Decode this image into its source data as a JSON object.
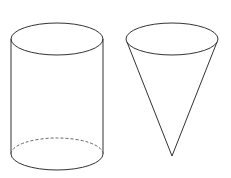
{
  "diagram": {
    "background": "#ffffff",
    "line_color": "#333333",
    "shapes": [
      {
        "name": "cylinder",
        "top_ellipse": {
          "cx": 57,
          "cy": 39,
          "rx": 46,
          "ry": 16
        },
        "bottom_ellipse": {
          "cx": 57,
          "cy": 154,
          "rx": 46,
          "ry": 16,
          "back_half": "dashed"
        },
        "sides": [
          {
            "x": 11,
            "y1": 39,
            "y2": 154
          },
          {
            "x": 103,
            "y1": 39,
            "y2": 154
          }
        ]
      },
      {
        "name": "cone",
        "top_ellipse": {
          "cx": 172,
          "cy": 39,
          "rx": 46,
          "ry": 16
        },
        "apex": {
          "x": 172,
          "y": 156
        },
        "sides": [
          {
            "x1": 127,
            "y1": 42,
            "x2": 172,
            "y2": 156
          },
          {
            "x1": 217,
            "y1": 42,
            "x2": 172,
            "y2": 156
          }
        ]
      }
    ]
  }
}
